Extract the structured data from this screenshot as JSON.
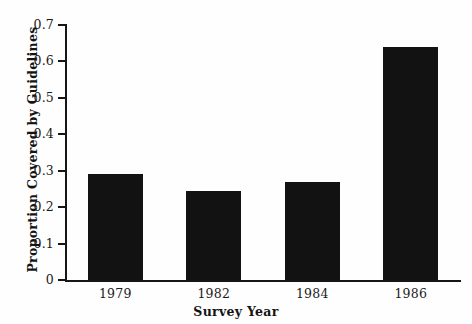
{
  "chart_data": {
    "type": "bar",
    "title": "",
    "subtitle": "",
    "xlabel": "Survey Year",
    "ylabel": "Proportion Covered by Guidelines",
    "categories": [
      "1979",
      "1982",
      "1984",
      "1986"
    ],
    "values": [
      0.29,
      0.245,
      0.27,
      0.64
    ],
    "ylim": [
      0,
      0.7
    ],
    "ytick_labels": [
      "0",
      "0.1",
      "0.2",
      "0.3",
      "0.4",
      "0.5",
      "0.6",
      "0.7"
    ],
    "ytick_values": [
      0,
      0.1,
      0.2,
      0.3,
      0.4,
      0.5,
      0.6,
      0.7
    ],
    "grid": false,
    "legend": false,
    "legend_position": "none",
    "bar_color": "#121212",
    "axis_color": "#161616",
    "background_color": "#ffffff"
  }
}
